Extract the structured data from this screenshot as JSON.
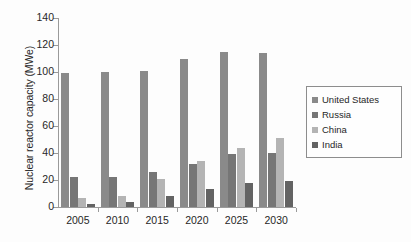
{
  "chart_data": {
    "type": "bar",
    "title": "",
    "xlabel": "",
    "ylabel": "Nuclear reactor capacity (MWe)",
    "categories": [
      "2005",
      "2010",
      "2015",
      "2020",
      "2025",
      "2030"
    ],
    "series": [
      {
        "name": "United States",
        "color": "#8a8a8a",
        "values": [
          99,
          100,
          101,
          110,
          115,
          114
        ]
      },
      {
        "name": "Russia",
        "color": "#767676",
        "values": [
          22,
          22,
          26,
          32,
          39,
          40
        ]
      },
      {
        "name": "China",
        "color": "#b4b4b4",
        "values": [
          7,
          8,
          21,
          34,
          44,
          51
        ]
      },
      {
        "name": "India",
        "color": "#636363",
        "values": [
          2,
          4,
          8,
          13,
          18,
          19
        ]
      }
    ],
    "ylim": [
      0,
      140
    ],
    "yticks": [
      "0",
      "20",
      "40",
      "60",
      "80",
      "100",
      "120",
      "140"
    ],
    "grid": false,
    "legend_position": "right"
  }
}
